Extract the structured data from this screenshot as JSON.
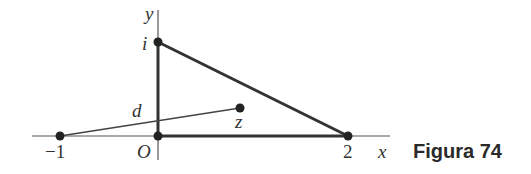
{
  "figure": {
    "caption": "Figura 74",
    "axes": {
      "x_label": "x",
      "y_label": "y",
      "origin_label": "O"
    },
    "points": {
      "i": {
        "label": "i",
        "coord": [
          0,
          1
        ]
      },
      "origin": {
        "label": "O",
        "coord": [
          0,
          0
        ]
      },
      "two": {
        "label": "2",
        "coord": [
          2,
          0
        ]
      },
      "minus_one": {
        "label": "−1",
        "coord": [
          -1,
          0
        ]
      },
      "z": {
        "label": "z"
      }
    },
    "segment_labels": {
      "d": "d"
    },
    "colors": {
      "line": "#333333",
      "text": "#333333"
    }
  }
}
